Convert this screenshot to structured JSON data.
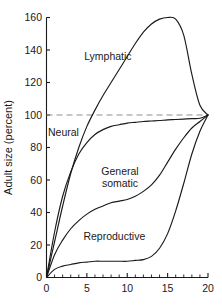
{
  "chart_data": {
    "type": "line",
    "title": "",
    "subtitle": "",
    "xlabel": "",
    "ylabel": "Adult size (percent)",
    "xlim": [
      0,
      20
    ],
    "ylim": [
      0,
      160
    ],
    "grid": false,
    "legend_position": "inline-annotations",
    "x_ticks": [
      "0",
      "5",
      "10",
      "15",
      "20"
    ],
    "x_tick_values": [
      0,
      5,
      10,
      15,
      20
    ],
    "x_minor_tick_values": [
      1,
      2,
      3,
      4,
      6,
      7,
      8,
      9,
      11,
      12,
      13,
      14,
      16,
      17,
      18,
      19
    ],
    "y_ticks": [
      "0",
      "20",
      "40",
      "60",
      "80",
      "100",
      "120",
      "140",
      "160"
    ],
    "y_tick_values": [
      0,
      20,
      40,
      60,
      80,
      100,
      120,
      140,
      160
    ],
    "annotations": [
      {
        "text": "Lymphatic",
        "x": 7.6,
        "y": 134
      },
      {
        "text": "Neural",
        "x": 2.1,
        "y": 87
      },
      {
        "text": "General somatic",
        "line1": "General",
        "line2": "somatic",
        "x": 9.1,
        "y": 63
      },
      {
        "text": "Reproductive",
        "x": 8.4,
        "y": 23
      }
    ],
    "reference_lines": [
      {
        "orientation": "horizontal",
        "value": 100,
        "style": "dashed",
        "color": "#8d8d8d"
      }
    ],
    "x": [
      0,
      1,
      2,
      3,
      4,
      5,
      6,
      7,
      8,
      9,
      10,
      11,
      12,
      13,
      14,
      15,
      16,
      17,
      18,
      19,
      20
    ],
    "series": [
      {
        "name": "Lymphatic",
        "color": "#1a1a1a",
        "values": [
          0,
          22,
          44,
          64,
          80,
          93,
          103,
          112,
          120,
          128,
          136,
          144,
          151,
          156,
          159,
          160,
          159,
          149,
          125,
          106,
          100
        ]
      },
      {
        "name": "Neural",
        "color": "#1a1a1a",
        "values": [
          0,
          28,
          50,
          65,
          76,
          83,
          88,
          91,
          93,
          94,
          95,
          95.5,
          96,
          96.3,
          96.6,
          97,
          97.2,
          97.5,
          97.8,
          98,
          100
        ]
      },
      {
        "name": "General somatic",
        "color": "#1a1a1a",
        "values": [
          0,
          14,
          23,
          30,
          35,
          39,
          42,
          44,
          46,
          47,
          48,
          50,
          53,
          57,
          63,
          71,
          79,
          86,
          92,
          96,
          100
        ]
      },
      {
        "name": "Reproductive",
        "color": "#1a1a1a",
        "values": [
          0,
          5,
          7,
          8,
          9,
          9.5,
          10,
          10,
          10,
          10,
          10,
          10.5,
          11,
          13,
          18,
          27,
          41,
          58,
          76,
          90,
          100
        ]
      }
    ]
  }
}
